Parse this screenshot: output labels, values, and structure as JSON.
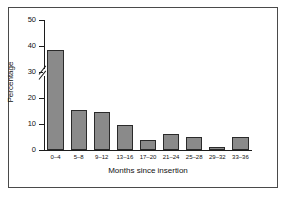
{
  "chart_data": {
    "type": "bar",
    "title": "",
    "xlabel": "Months since insertion",
    "ylabel": "Percentage",
    "categories": [
      "0–4",
      "5–8",
      "9–12",
      "13–16",
      "17–20",
      "21–24",
      "25–28",
      "29–32",
      "33–36"
    ],
    "values": [
      38.5,
      15.5,
      14.5,
      9.5,
      4.0,
      6.0,
      5.0,
      1.0,
      5.0
    ],
    "ylim": [
      0,
      50
    ],
    "yticks": [
      0,
      10,
      20,
      30,
      40,
      50
    ],
    "ytick_labels": [
      "0",
      "10",
      "20",
      "30",
      "40",
      "50"
    ],
    "axis_break": {
      "between": [
        20,
        30
      ],
      "style": "double-slash"
    },
    "grid": false,
    "legend": null,
    "bar_color": "#8a8a8a",
    "bar_edge_color": "#2a2a2a",
    "axis_color": "#1c1c1c",
    "frame_color": "#4a4a4a",
    "background": "#ffffff"
  }
}
